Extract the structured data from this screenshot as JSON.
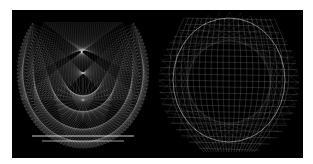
{
  "figure": {
    "background": "#ffffff",
    "panel_background": "#000000",
    "line_color": "#ffffff",
    "panels": [
      {
        "id": "left",
        "description": "Wireframe string-art pattern forming a rounded cup/shield shape with crossing diagonal lines and a central star burst"
      },
      {
        "id": "right",
        "description": "Dense wireframe mesh forming a rounded bowl/sphere shape with grid-like crossing lines"
      }
    ]
  }
}
